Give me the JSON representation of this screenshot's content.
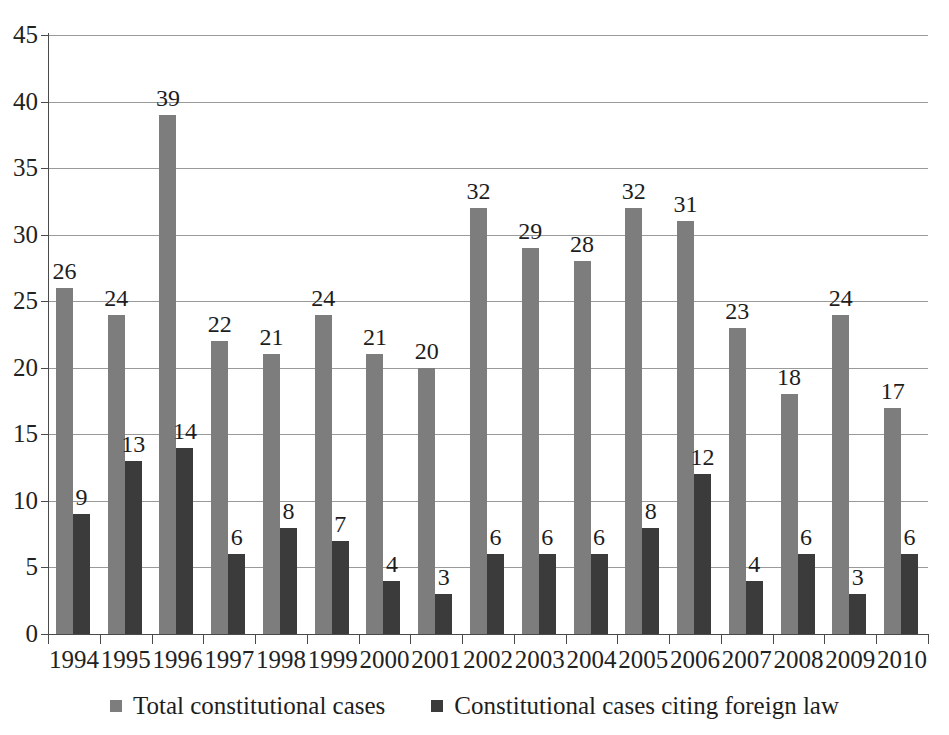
{
  "chart_data": {
    "type": "bar",
    "title": "",
    "subtitle": "",
    "xlabel": "",
    "ylabel": "",
    "ylim": [
      0,
      45
    ],
    "ytick_step": 5,
    "yticks": [
      0,
      5,
      10,
      15,
      20,
      25,
      30,
      35,
      40,
      45
    ],
    "grid": true,
    "legend_position": "bottom",
    "categories": [
      "1994",
      "1995",
      "1996",
      "1997",
      "1998",
      "1999",
      "2000",
      "2001",
      "2002",
      "2003",
      "2004",
      "2005",
      "2006",
      "2007",
      "2008",
      "2009",
      "2010"
    ],
    "series": [
      {
        "name": "Total constitutional cases",
        "color": "#7d7d7d",
        "values": [
          26,
          24,
          39,
          22,
          21,
          24,
          21,
          20,
          32,
          29,
          28,
          32,
          31,
          23,
          18,
          24,
          17
        ]
      },
      {
        "name": "Constitutional cases citing foreign law",
        "color": "#3b3b3b",
        "values": [
          9,
          13,
          14,
          6,
          8,
          7,
          4,
          3,
          6,
          6,
          6,
          8,
          12,
          4,
          6,
          3,
          6
        ]
      }
    ]
  },
  "legend": {
    "items": [
      {
        "label": "Total constitutional cases",
        "swatch": "total"
      },
      {
        "label": "Constitutional cases citing foreign law",
        "swatch": "foreign"
      }
    ]
  }
}
